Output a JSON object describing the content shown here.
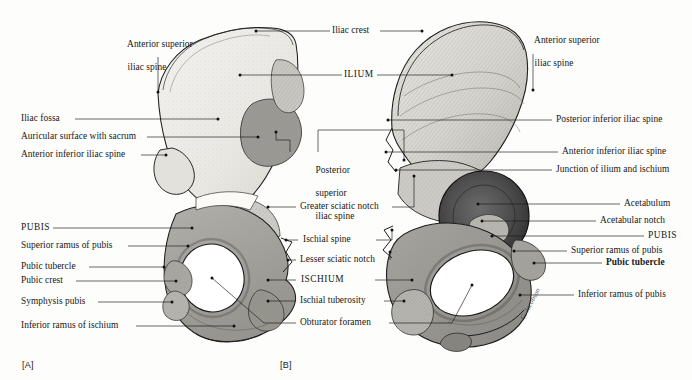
{
  "figure": {
    "panel_a_caption": "[A]",
    "panel_b_caption": "[B]",
    "background_color": "#fdfdfb",
    "ink_color": "#1b1b1b"
  },
  "panel_a": {
    "view": "medial view of right hip bone",
    "labels_left": [
      {
        "text": "Iliac fossa",
        "x": 21,
        "y": 115
      },
      {
        "text": "Auricular surface with sacrum",
        "x": 21,
        "y": 133
      },
      {
        "text": "Anterior inferior iliac spine",
        "x": 21,
        "y": 151
      },
      {
        "text": "PUBIS",
        "x": 21,
        "y": 224
      },
      {
        "text": "Superior ramus of pubis",
        "x": 21,
        "y": 242
      },
      {
        "text": "Pubic tubercle",
        "x": 21,
        "y": 263
      },
      {
        "text": "Pubic crest",
        "x": 21,
        "y": 277
      },
      {
        "text": "Symphysis pubis",
        "x": 21,
        "y": 298
      },
      {
        "text": "Inferior ramus of ischium",
        "x": 21,
        "y": 322
      }
    ],
    "labels_top": [
      {
        "line1": "Anterior superior",
        "line2": "iliac spine",
        "x": 118,
        "y": 27
      }
    ]
  },
  "panel_b": {
    "view": "lateral view of right hip bone",
    "labels_right": [
      {
        "line1": "Anterior superior",
        "line2": "iliac spine",
        "x": 525,
        "y": 25
      },
      {
        "text": "Posterior inferior iliac spine",
        "x": 556,
        "y": 116
      },
      {
        "text": "Anterior inferior iliac spine",
        "x": 562,
        "y": 148
      },
      {
        "text": "Junction of ilium and ischium",
        "x": 556,
        "y": 166
      },
      {
        "text": "Acetabulum",
        "x": 624,
        "y": 200
      },
      {
        "text": "Acetabular notch",
        "x": 600,
        "y": 217
      },
      {
        "text": "PUBIS",
        "x": 648,
        "y": 232
      },
      {
        "text": "Superior ramus of pubis",
        "x": 571,
        "y": 247
      },
      {
        "text": "Pubic tubercle",
        "x": 606,
        "y": 259
      },
      {
        "text": "Inferior ramus of pubis",
        "x": 578,
        "y": 291
      }
    ]
  },
  "shared_labels": {
    "center_top": [
      {
        "text": "Iliac crest",
        "x": 332,
        "y": 27
      },
      {
        "text": "ILIUM",
        "x": 344,
        "y": 71
      }
    ],
    "center_middle": [
      {
        "line1": "Posterior",
        "line2": "superior",
        "line3": "iliac spine",
        "x": 306,
        "y": 155
      },
      {
        "text": "Greater sciatic notch",
        "x": 306,
        "y": 203
      },
      {
        "text": "Ischial spine",
        "x": 310,
        "y": 236
      },
      {
        "text": "Lesser sciatic notch",
        "x": 304,
        "y": 256
      },
      {
        "text": "ISCHIUM",
        "x": 331,
        "y": 276
      },
      {
        "text": "Ischial tuberosity",
        "x": 308,
        "y": 297
      },
      {
        "text": "Obturator foramen",
        "x": 304,
        "y": 319
      }
    ]
  },
  "artist_signature": "C. Jacobson"
}
